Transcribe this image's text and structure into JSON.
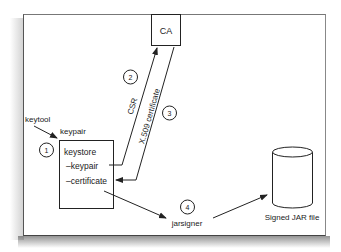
{
  "diagram": {
    "nodes": {
      "ca": {
        "label": "CA"
      },
      "keystore": {
        "title": "keystore",
        "items": [
          "–keypair",
          "–certificate"
        ]
      },
      "signed_jar": {
        "label": "Signed JAR file"
      },
      "jarsigner": {
        "label": "jarsigner"
      }
    },
    "labels": {
      "keytool": "keytool",
      "keypair": "keypair",
      "csr": "CSR",
      "x509": "X.509 certificate"
    },
    "steps": [
      "1",
      "2",
      "3",
      "4"
    ],
    "colors": {
      "line": "#222222",
      "background": "#ffffff",
      "frame": "#555555"
    }
  }
}
